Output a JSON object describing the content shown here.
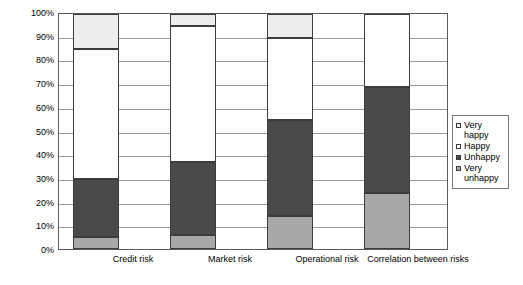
{
  "chart_data": {
    "type": "bar",
    "stacked": true,
    "percent_stacked": true,
    "title": "",
    "xlabel": "",
    "ylabel": "",
    "ylim": [
      0,
      100
    ],
    "grid": true,
    "legend_position": "right",
    "categories": [
      "Credit risk",
      "Market risk",
      "Operational risk",
      "Correlation between risks"
    ],
    "ytick_labels": [
      "100%",
      "90%",
      "80%",
      "70%",
      "60%",
      "50%",
      "40%",
      "30%",
      "20%",
      "10%",
      "0%"
    ],
    "ytick_values": [
      100,
      90,
      80,
      70,
      60,
      50,
      40,
      30,
      20,
      10,
      0
    ],
    "series": [
      {
        "name": "Very happy",
        "color": "#ededed",
        "values": [
          15,
          5,
          10,
          0
        ]
      },
      {
        "name": "Happy",
        "color": "#fefefe",
        "values": [
          55,
          58,
          35,
          31
        ]
      },
      {
        "name": "Unhappy",
        "color": "#4a4a4a",
        "values": [
          25,
          31,
          41,
          45
        ]
      },
      {
        "name": "Very unhappy",
        "color": "#a8a8a8",
        "values": [
          5,
          6,
          14,
          24
        ]
      }
    ],
    "cumulative_tops": {
      "Credit risk": {
        "very_unhappy": 5,
        "unhappy": 30,
        "happy": 85,
        "very_happy": 100
      },
      "Market risk": {
        "very_unhappy": 6,
        "unhappy": 37,
        "happy": 95,
        "very_happy": 100
      },
      "Operational risk": {
        "very_unhappy": 14,
        "unhappy": 55,
        "happy": 90,
        "very_happy": 100
      },
      "Correlation between risks": {
        "very_unhappy": 24,
        "unhappy": 69,
        "happy": 100,
        "very_happy": 100
      }
    }
  },
  "legend": {
    "items": [
      {
        "label": "Very happy"
      },
      {
        "label": "Happy"
      },
      {
        "label": "Unhappy"
      },
      {
        "label": "Very unhappy"
      }
    ]
  },
  "yaxis": {
    "t0": "100%",
    "t1": "90%",
    "t2": "80%",
    "t3": "70%",
    "t4": "60%",
    "t5": "50%",
    "t6": "40%",
    "t7": "30%",
    "t8": "20%",
    "t9": "10%",
    "t10": "0%"
  },
  "xaxis": {
    "c0": "Credit risk",
    "c1": "Market risk",
    "c2": "Operational risk",
    "c3": "Correlation between risks"
  }
}
